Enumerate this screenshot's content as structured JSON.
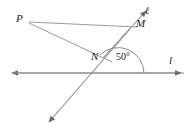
{
  "figure": {
    "type": "geometry-diagram",
    "width": 195,
    "height": 136,
    "background_color": "#ffffff",
    "stroke_color": "#808080",
    "text_color": "#1a1a1a"
  },
  "labels": {
    "point_p": "P",
    "point_m": "M",
    "point_n": "N",
    "line_ell": "ℓ",
    "line_l": "l",
    "angle_value": "50°"
  },
  "geometry": {
    "points": {
      "P": [
        27,
        22
      ],
      "M": [
        136,
        28
      ],
      "N": [
        103,
        58
      ],
      "vertex": [
        118,
        73
      ],
      "ell_tip": [
        144,
        12
      ],
      "transversal_tip": [
        47,
        124
      ],
      "line_left_tip": [
        9,
        73
      ],
      "line_right_tip": [
        184,
        73
      ]
    },
    "segments": [
      {
        "name": "segment-PM",
        "from": "P",
        "to": "M"
      },
      {
        "name": "segment-PN",
        "from": "P",
        "to": "N"
      },
      {
        "name": "line-ell-transversal",
        "from": "ell_tip",
        "to": "transversal_tip"
      },
      {
        "name": "line-l-horizontal",
        "from": "line_left_tip",
        "to": "line_right_tip"
      }
    ],
    "angle_arc": {
      "name": "angle-arc-50",
      "vertex": [
        118,
        73
      ],
      "radius": 26,
      "measure_degrees": 50
    }
  }
}
